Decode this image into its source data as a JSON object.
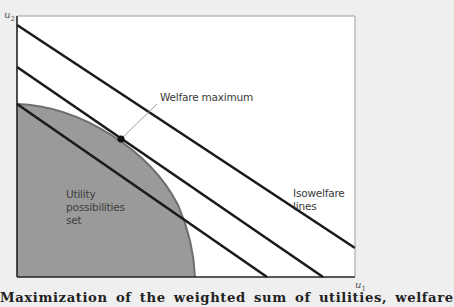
{
  "axes": {
    "y_label": "u",
    "y_sub": "2",
    "x_label": "u",
    "x_sub": "1"
  },
  "labels": {
    "welfare_maximum": "Welfare maximum",
    "isowelfare_line1": "Isowelfare",
    "isowelfare_line2": "lines",
    "ups_line1": "Utility",
    "ups_line2": "possibilities",
    "ups_line3": "set"
  },
  "caption": "Maximization of the weighted sum of utilities, welfare",
  "colors": {
    "background": "#efefef",
    "plot": "#ffffff",
    "ups_fill": "#9a9a9a",
    "ups_edge": "#6f6f6f",
    "lines": "#1a1a1a"
  },
  "diagram": {
    "plot_box": {
      "left": 17,
      "top": 16,
      "right": 355,
      "bottom": 277
    },
    "isowelfare_lines": [
      {
        "x1": 17,
        "y1": 25,
        "x2": 355,
        "y2": 248
      },
      {
        "x1": 17,
        "y1": 67,
        "x2": 323,
        "y2": 277
      },
      {
        "x1": 17,
        "y1": 104,
        "x2": 267,
        "y2": 277
      }
    ],
    "welfare_max_point": {
      "x": 121,
      "y": 139
    },
    "utility_frontier": {
      "start": [
        17,
        104
      ],
      "end": [
        195,
        277
      ]
    }
  }
}
